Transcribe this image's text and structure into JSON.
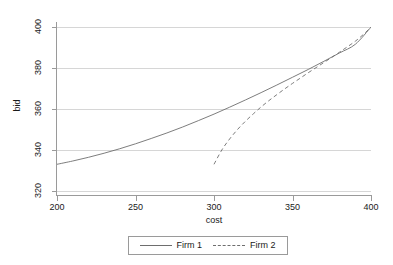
{
  "chart_data": {
    "type": "line",
    "title": "",
    "xlabel": "cost",
    "ylabel": "bid",
    "xlim": [
      200,
      400
    ],
    "ylim": [
      318,
      402
    ],
    "xticks": [
      200,
      250,
      300,
      350,
      400
    ],
    "yticks": [
      320,
      340,
      360,
      380,
      400
    ],
    "grid": "horizontal",
    "legend_position": "bottom-center",
    "series": [
      {
        "name": "Firm 1",
        "style": "solid",
        "color": "#6e6e6e",
        "x": [
          200,
          210,
          220,
          230,
          240,
          250,
          260,
          270,
          280,
          290,
          300,
          310,
          320,
          330,
          340,
          350,
          360,
          370,
          380,
          390,
          400
        ],
        "y": [
          333.0,
          334.6,
          336.4,
          338.4,
          340.6,
          343.0,
          345.6,
          348.3,
          351.2,
          354.3,
          357.5,
          360.9,
          364.4,
          368.0,
          371.7,
          375.5,
          379.3,
          383.3,
          387.4,
          391.6,
          400.0
        ]
      },
      {
        "name": "Firm 2",
        "style": "dashed",
        "color": "#6e6e6e",
        "x": [
          300,
          305,
          310,
          315,
          320,
          325,
          330,
          335,
          340,
          345,
          350,
          355,
          360,
          365,
          370,
          375,
          380,
          385,
          390,
          395,
          400
        ],
        "y": [
          333.0,
          340.0,
          345.4,
          350.0,
          354.0,
          357.6,
          361.0,
          364.1,
          367.0,
          369.8,
          372.5,
          375.1,
          377.7,
          380.2,
          382.7,
          385.2,
          387.8,
          390.4,
          393.1,
          396.3,
          400.0
        ]
      }
    ]
  },
  "legend": {
    "entries": [
      {
        "label": "Firm 1",
        "style": "solid"
      },
      {
        "label": "Firm 2",
        "style": "dashed"
      }
    ]
  },
  "axes": {
    "x_tick_labels": [
      "200",
      "250",
      "300",
      "350",
      "400"
    ],
    "y_tick_labels": [
      "320",
      "340",
      "360",
      "380",
      "400"
    ],
    "x_title": "cost",
    "y_title": "bid"
  },
  "colors": {
    "series_line": "#6e6e6e",
    "gridline": "#d6d6d6",
    "axis": "#9a9a9a",
    "text": "#1a1a1a",
    "background": "#ffffff"
  }
}
